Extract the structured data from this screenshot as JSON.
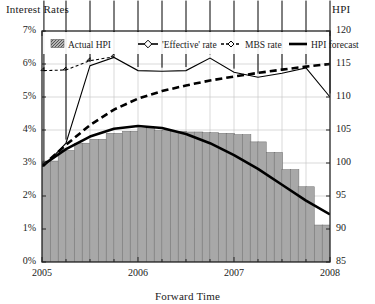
{
  "chart_data": {
    "type": "bar",
    "title": "",
    "xlabel": "Forward Time",
    "ylabel": "Interest Rates",
    "y2label": "HPI",
    "grid": true,
    "legend_position": "top-inside",
    "x": [
      "2005",
      "2006",
      "2007",
      "2008"
    ],
    "xlim": [
      2005,
      2008
    ],
    "ylim": [
      0,
      7
    ],
    "y2lim": [
      85,
      120
    ],
    "ytick_labels": [
      "0%",
      "1%",
      "2%",
      "3%",
      "4%",
      "5%",
      "6%",
      "7%"
    ],
    "ytick_values": [
      0,
      1,
      2,
      3,
      4,
      5,
      6,
      7
    ],
    "y2tick_labels": [
      "85",
      "90",
      "95",
      "100",
      "105",
      "110",
      "115",
      "120"
    ],
    "y2tick_values": [
      85,
      90,
      95,
      100,
      105,
      110,
      115,
      120
    ],
    "xtick_labels": [
      "2005",
      "2006",
      "2007",
      "2008"
    ],
    "xtick_values": [
      2005,
      2006,
      2007,
      2008
    ],
    "series": [
      {
        "name": "Actual HPI",
        "type": "bar",
        "axis": "y2",
        "x": [
          2005.04,
          2005.13,
          2005.21,
          2005.29,
          2005.38,
          2005.46,
          2005.54,
          2005.63,
          2005.71,
          2005.79,
          2005.88,
          2005.96,
          2006.04,
          2006.13,
          2006.21,
          2006.29,
          2006.38,
          2006.46,
          2006.54,
          2006.63,
          2006.71,
          2006.79,
          2006.88,
          2006.96,
          2007.04,
          2007.13,
          2007.21,
          2007.29,
          2007.38,
          2007.46,
          2007.54,
          2007.63,
          2007.71,
          2007.79,
          2007.88,
          2007.96
        ],
        "values": [
          100.3,
          100.3,
          101.9,
          101.9,
          103.0,
          103.0,
          103.6,
          103.6,
          104.5,
          104.5,
          104.8,
          104.8,
          105.2,
          105.2,
          104.9,
          104.9,
          104.8,
          104.8,
          104.7,
          104.7,
          104.6,
          104.6,
          104.5,
          104.5,
          104.3,
          104.3,
          103.2,
          103.2,
          101.6,
          101.6,
          99.0,
          99.0,
          96.4,
          96.4,
          90.6,
          90.6
        ]
      },
      {
        "name": "'Effective' rate",
        "type": "line",
        "axis": "y",
        "marker": "diamond-large",
        "linestyle": "solid",
        "x": [
          2005.02,
          2005.25,
          2005.5,
          2005.75,
          2006.0,
          2006.25,
          2006.5,
          2006.75,
          2007.0,
          2007.25,
          2007.5,
          2007.75,
          2008.0
        ],
        "values": [
          2.9,
          3.6,
          5.95,
          6.2,
          5.8,
          5.78,
          5.8,
          6.18,
          5.75,
          5.6,
          5.72,
          5.88,
          5.0
        ]
      },
      {
        "name": "MBS rate",
        "type": "line",
        "axis": "y",
        "marker": "diamond-small",
        "linestyle": "dashed",
        "x": [
          2005.02,
          2005.25,
          2005.5,
          2005.75
        ],
        "values": [
          5.8,
          5.82,
          6.1,
          6.22
        ]
      },
      {
        "name": "HPI forecast",
        "type": "line",
        "axis": "y2",
        "marker": "none",
        "linestyle": "solid-thick",
        "x": [
          2005.0,
          2005.25,
          2005.5,
          2005.75,
          2006.0,
          2006.25,
          2006.5,
          2006.75,
          2007.0,
          2007.25,
          2007.5,
          2007.75,
          2008.0
        ],
        "values": [
          99.6,
          102.1,
          104.0,
          105.2,
          105.6,
          105.3,
          104.4,
          103.0,
          101.2,
          99.1,
          96.7,
          94.3,
          92.2
        ]
      },
      {
        "name": "MBS forecast curve",
        "type": "line",
        "axis": "y",
        "marker": "none",
        "linestyle": "dashed-thick",
        "x": [
          2005.0,
          2005.25,
          2005.5,
          2005.75,
          2006.0,
          2006.25,
          2006.5,
          2006.75,
          2007.0,
          2007.25,
          2007.5,
          2007.75,
          2008.0
        ],
        "values": [
          2.9,
          3.55,
          4.15,
          4.62,
          4.95,
          5.18,
          5.35,
          5.5,
          5.62,
          5.73,
          5.83,
          5.92,
          6.0
        ]
      }
    ]
  },
  "legend": {
    "items": [
      {
        "label": "Actual HPI",
        "marker": "hatched-swatch"
      },
      {
        "label": "'Effective' rate",
        "marker": "diamond-large-line"
      },
      {
        "label": "MBS rate",
        "marker": "diamond-small-dashed"
      },
      {
        "label": "HPI forecast",
        "marker": "solid-line"
      }
    ]
  },
  "colors": {
    "bar_fill": "#a8a8a8",
    "bar_edge": "#6b6b6b",
    "line": "#000000",
    "grid": "#c9c9c9",
    "axis": "#222222",
    "background": "#ffffff"
  }
}
